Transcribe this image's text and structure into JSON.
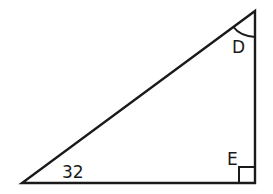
{
  "diagram": {
    "type": "right-triangle",
    "vertices": {
      "top": {
        "x": 255,
        "y": 11
      },
      "bottom_left": {
        "x": 22,
        "y": 183
      },
      "bottom_right": {
        "x": 255,
        "y": 183
      }
    },
    "labels": {
      "angle_top": "D",
      "right_angle": "E",
      "angle_bottom_left": "32"
    },
    "stroke_color": "#1a1a1a",
    "background": "#ffffff"
  }
}
